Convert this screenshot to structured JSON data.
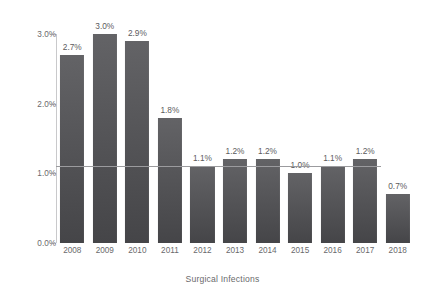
{
  "chart_data": {
    "type": "bar",
    "title": "",
    "xlabel": "Surgical Infections",
    "ylabel": "Infection Rate",
    "categories": [
      "2008",
      "2009",
      "2010",
      "2011",
      "2012",
      "2013",
      "2014",
      "2015",
      "2016",
      "2017",
      "2018"
    ],
    "values": [
      2.7,
      3.0,
      2.9,
      1.8,
      1.1,
      1.2,
      1.2,
      1.0,
      1.1,
      1.2,
      0.7
    ],
    "value_labels": [
      "2.7%",
      "3.0%",
      "2.9%",
      "1.8%",
      "1.1%",
      "1.2%",
      "1.2%",
      "1.0%",
      "1.1%",
      "1.2%",
      "0.7%"
    ],
    "ylim": [
      0.0,
      3.0
    ],
    "ytick_values": [
      0.0,
      1.0,
      2.0,
      3.0
    ],
    "ytick_labels": [
      "0.0%",
      "1.0%",
      "2.0%",
      "3.0%"
    ],
    "grid": false,
    "legend": "none",
    "reference_line": {
      "value": 1.1,
      "label": "",
      "color": "#9b9b9e",
      "extent_categories": [
        "2008",
        "2017"
      ]
    },
    "series": [
      {
        "name": "Infection Rate",
        "values": [
          2.7,
          3.0,
          2.9,
          1.8,
          1.1,
          1.2,
          1.2,
          1.0,
          1.1,
          1.2,
          0.7
        ],
        "color": "#555558"
      }
    ],
    "colors": {
      "bar": "#555558",
      "bar_top": "#636366",
      "bar_bottom": "#454548",
      "axis": "#c9c9cb",
      "text": "#6a6a6c",
      "reference_line": "#9b9b9e",
      "background": "#ffffff"
    }
  }
}
